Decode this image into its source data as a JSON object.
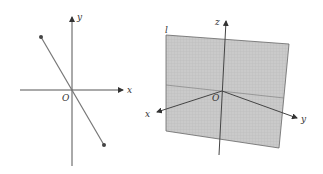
{
  "figure_left": {
    "axis_labels": {
      "x": "x",
      "y": "y",
      "origin": "O"
    },
    "segment": {
      "start_point": [
        41,
        37
      ],
      "end_point": [
        104,
        145
      ]
    },
    "colors": {
      "axis": "#555555",
      "segment": "#777777",
      "point": "#444444"
    }
  },
  "figure_right": {
    "axis_labels": {
      "x": "x",
      "y": "y",
      "z": "z",
      "origin": "O"
    },
    "plane_label": "l",
    "colors": {
      "plane_fill": "#c8c8c8",
      "plane_grid": "#b4b4b4",
      "plane_edge": "#666666",
      "axis": "#444444"
    }
  }
}
